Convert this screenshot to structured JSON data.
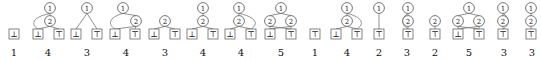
{
  "figure": {
    "kind": "decision-diagram-strip",
    "count": 16,
    "node_colors": {
      "stroke": "#555555",
      "text": "#222222",
      "edge": "#777777",
      "leaf_stroke": "#666666",
      "label": "#111111",
      "background": "#ffffff"
    },
    "glyphs": {
      "var1": "1",
      "var2": "2",
      "leaf_false": "⊥",
      "leaf_true": "⊤"
    },
    "diagrams": [
      {
        "index": 1,
        "size_label": "1",
        "width": 28,
        "nodes": [],
        "leaves": [
          {
            "id": "l0",
            "glyph": "⊥",
            "x": 14,
            "y": 34
          }
        ],
        "edges": []
      },
      {
        "index": 2,
        "size_label": "4",
        "width": 40,
        "nodes": [
          {
            "id": "n1",
            "glyph": "1",
            "x": 22,
            "y": 8
          },
          {
            "id": "n2",
            "glyph": "2",
            "x": 22,
            "y": 21
          }
        ],
        "leaves": [
          {
            "id": "l0",
            "glyph": "⊥",
            "x": 10,
            "y": 34
          },
          {
            "id": "l1",
            "glyph": "⊤",
            "x": 31,
            "y": 34
          }
        ],
        "edges": [
          {
            "from": "n1",
            "to": "l0",
            "style": "curve-left"
          },
          {
            "from": "n1",
            "to": "n2",
            "style": "straight"
          },
          {
            "from": "n2",
            "to": "l0",
            "style": "straight"
          },
          {
            "from": "n2",
            "to": "l1",
            "style": "straight"
          }
        ]
      },
      {
        "index": 3,
        "size_label": "3",
        "width": 38,
        "nodes": [
          {
            "id": "n1",
            "glyph": "1",
            "x": 19,
            "y": 8
          }
        ],
        "leaves": [
          {
            "id": "l0",
            "glyph": "⊥",
            "x": 8,
            "y": 34
          },
          {
            "id": "l1",
            "glyph": "⊤",
            "x": 29,
            "y": 34
          }
        ],
        "edges": [
          {
            "from": "n1",
            "to": "l0",
            "style": "straight"
          },
          {
            "from": "n1",
            "to": "l1",
            "style": "straight"
          }
        ]
      },
      {
        "index": 4,
        "size_label": "4",
        "width": 40,
        "nodes": [
          {
            "id": "n1",
            "glyph": "1",
            "x": 17,
            "y": 8
          },
          {
            "id": "n2",
            "glyph": "2",
            "x": 30,
            "y": 21
          }
        ],
        "leaves": [
          {
            "id": "l0",
            "glyph": "⊥",
            "x": 9,
            "y": 34
          },
          {
            "id": "l1",
            "glyph": "⊤",
            "x": 29,
            "y": 34
          }
        ],
        "edges": [
          {
            "from": "n1",
            "to": "l0",
            "style": "curve-left"
          },
          {
            "from": "n1",
            "to": "n2",
            "style": "straight"
          },
          {
            "from": "n2",
            "to": "l0",
            "style": "straight"
          },
          {
            "from": "n2",
            "to": "l1",
            "style": "straight"
          }
        ]
      },
      {
        "index": 5,
        "size_label": "3",
        "width": 38,
        "nodes": [
          {
            "id": "n1",
            "glyph": "2",
            "x": 19,
            "y": 21
          }
        ],
        "leaves": [
          {
            "id": "l0",
            "glyph": "⊥",
            "x": 8,
            "y": 34
          },
          {
            "id": "l1",
            "glyph": "⊤",
            "x": 29,
            "y": 34
          }
        ],
        "edges": [
          {
            "from": "n1",
            "to": "l0",
            "style": "straight"
          },
          {
            "from": "n1",
            "to": "l1",
            "style": "straight"
          }
        ]
      },
      {
        "index": 6,
        "size_label": "4",
        "width": 38,
        "nodes": [
          {
            "id": "n1",
            "glyph": "1",
            "x": 19,
            "y": 8
          },
          {
            "id": "n2",
            "glyph": "2",
            "x": 19,
            "y": 21
          }
        ],
        "leaves": [
          {
            "id": "l0",
            "glyph": "⊥",
            "x": 8,
            "y": 34
          },
          {
            "id": "l1",
            "glyph": "⊤",
            "x": 29,
            "y": 34
          }
        ],
        "edges": [
          {
            "from": "n1",
            "to": "n2",
            "style": "straight"
          },
          {
            "from": "n2",
            "to": "l0",
            "style": "straight"
          },
          {
            "from": "n2",
            "to": "l1",
            "style": "straight"
          }
        ]
      },
      {
        "index": 7,
        "size_label": "4",
        "width": 38,
        "nodes": [
          {
            "id": "n1",
            "glyph": "1",
            "x": 17,
            "y": 8
          },
          {
            "id": "n2",
            "glyph": "2",
            "x": 17,
            "y": 21
          }
        ],
        "leaves": [
          {
            "id": "l0",
            "glyph": "⊥",
            "x": 8,
            "y": 34
          },
          {
            "id": "l1",
            "glyph": "⊤",
            "x": 29,
            "y": 34
          }
        ],
        "edges": [
          {
            "from": "n1",
            "to": "l1",
            "style": "curve-right"
          },
          {
            "from": "n1",
            "to": "n2",
            "style": "straight"
          },
          {
            "from": "n2",
            "to": "l0",
            "style": "straight"
          },
          {
            "from": "n2",
            "to": "l1",
            "style": "straight"
          }
        ]
      },
      {
        "index": 8,
        "size_label": "5",
        "width": 42,
        "nodes": [
          {
            "id": "n1",
            "glyph": "1",
            "x": 21,
            "y": 8
          },
          {
            "id": "n2",
            "glyph": "2",
            "x": 10,
            "y": 21
          },
          {
            "id": "n3",
            "glyph": "2",
            "x": 31,
            "y": 21
          }
        ],
        "leaves": [
          {
            "id": "l0",
            "glyph": "⊥",
            "x": 10,
            "y": 34
          },
          {
            "id": "l1",
            "glyph": "⊤",
            "x": 31,
            "y": 34
          }
        ],
        "edges": [
          {
            "from": "n1",
            "to": "n2",
            "style": "straight"
          },
          {
            "from": "n1",
            "to": "n3",
            "style": "straight"
          },
          {
            "from": "n2",
            "to": "l0",
            "style": "straight"
          },
          {
            "from": "n2",
            "to": "l1",
            "style": "straight"
          },
          {
            "from": "n3",
            "to": "l0",
            "style": "straight"
          },
          {
            "from": "n3",
            "to": "l1",
            "style": "straight"
          }
        ]
      },
      {
        "index": 9,
        "size_label": "1",
        "width": 26,
        "nodes": [],
        "leaves": [
          {
            "id": "l0",
            "glyph": "⊤",
            "x": 13,
            "y": 34
          }
        ],
        "edges": []
      },
      {
        "index": 10,
        "size_label": "4",
        "width": 38,
        "nodes": [
          {
            "id": "n1",
            "glyph": "1",
            "x": 19,
            "y": 8
          },
          {
            "id": "n2",
            "glyph": "2",
            "x": 19,
            "y": 21
          }
        ],
        "leaves": [
          {
            "id": "l0",
            "glyph": "⊥",
            "x": 8,
            "y": 34
          },
          {
            "id": "l1",
            "glyph": "⊤",
            "x": 29,
            "y": 34
          }
        ],
        "edges": [
          {
            "from": "n1",
            "to": "l1",
            "style": "curve-right"
          },
          {
            "from": "n1",
            "to": "n2",
            "style": "straight"
          },
          {
            "from": "n2",
            "to": "l0",
            "style": "straight"
          },
          {
            "from": "n2",
            "to": "l1",
            "style": "straight"
          }
        ]
      },
      {
        "index": 11,
        "size_label": "2",
        "width": 26,
        "nodes": [
          {
            "id": "n1",
            "glyph": "1",
            "x": 13,
            "y": 8
          }
        ],
        "leaves": [
          {
            "id": "l0",
            "glyph": "⊤",
            "x": 13,
            "y": 34
          }
        ],
        "edges": [
          {
            "from": "n1",
            "to": "l0",
            "style": "straight"
          }
        ]
      },
      {
        "index": 12,
        "size_label": "3",
        "width": 30,
        "nodes": [
          {
            "id": "n1",
            "glyph": "1",
            "x": 16,
            "y": 8
          },
          {
            "id": "n2",
            "glyph": "2",
            "x": 16,
            "y": 21
          }
        ],
        "leaves": [
          {
            "id": "l0",
            "glyph": "⊤",
            "x": 16,
            "y": 34
          }
        ],
        "edges": [
          {
            "from": "n1",
            "to": "l0",
            "style": "curve-left"
          },
          {
            "from": "n1",
            "to": "n2",
            "style": "straight"
          },
          {
            "from": "n2",
            "to": "l0",
            "style": "straight"
          }
        ]
      },
      {
        "index": 13,
        "size_label": "2",
        "width": 26,
        "nodes": [
          {
            "id": "n1",
            "glyph": "2",
            "x": 13,
            "y": 21
          }
        ],
        "leaves": [
          {
            "id": "l0",
            "glyph": "⊤",
            "x": 13,
            "y": 34
          }
        ],
        "edges": [
          {
            "from": "n1",
            "to": "l0",
            "style": "straight"
          }
        ]
      },
      {
        "index": 14,
        "size_label": "5",
        "width": 42,
        "nodes": [
          {
            "id": "n1",
            "glyph": "1",
            "x": 21,
            "y": 8
          },
          {
            "id": "n2",
            "glyph": "2",
            "x": 10,
            "y": 21
          },
          {
            "id": "n3",
            "glyph": "2",
            "x": 31,
            "y": 21
          }
        ],
        "leaves": [
          {
            "id": "l0",
            "glyph": "⊥",
            "x": 10,
            "y": 34
          },
          {
            "id": "l1",
            "glyph": "⊤",
            "x": 31,
            "y": 34
          }
        ],
        "edges": [
          {
            "from": "n1",
            "to": "n2",
            "style": "straight"
          },
          {
            "from": "n1",
            "to": "n3",
            "style": "straight"
          },
          {
            "from": "n2",
            "to": "l0",
            "style": "straight"
          },
          {
            "from": "n2",
            "to": "l1",
            "style": "straight"
          },
          {
            "from": "n3",
            "to": "l0",
            "style": "straight"
          },
          {
            "from": "n3",
            "to": "l1",
            "style": "straight"
          }
        ]
      },
      {
        "index": 15,
        "size_label": "3",
        "width": 28,
        "nodes": [
          {
            "id": "n1",
            "glyph": "1",
            "x": 13,
            "y": 8
          },
          {
            "id": "n2",
            "glyph": "2",
            "x": 13,
            "y": 21
          }
        ],
        "leaves": [
          {
            "id": "l0",
            "glyph": "⊤",
            "x": 13,
            "y": 34
          }
        ],
        "edges": [
          {
            "from": "n1",
            "to": "l0",
            "style": "curve-right"
          },
          {
            "from": "n1",
            "to": "n2",
            "style": "straight"
          },
          {
            "from": "n2",
            "to": "l0",
            "style": "straight"
          }
        ]
      },
      {
        "index": 16,
        "size_label": "3",
        "width": 28,
        "nodes": [
          {
            "id": "n1",
            "glyph": "1",
            "x": 13,
            "y": 8
          },
          {
            "id": "n2",
            "glyph": "2",
            "x": 13,
            "y": 21
          }
        ],
        "leaves": [
          {
            "id": "l0",
            "glyph": "⊤",
            "x": 13,
            "y": 34
          }
        ],
        "edges": [
          {
            "from": "n1",
            "to": "n2",
            "style": "straight"
          },
          {
            "from": "n2",
            "to": "l0",
            "style": "straight"
          }
        ]
      }
    ]
  }
}
